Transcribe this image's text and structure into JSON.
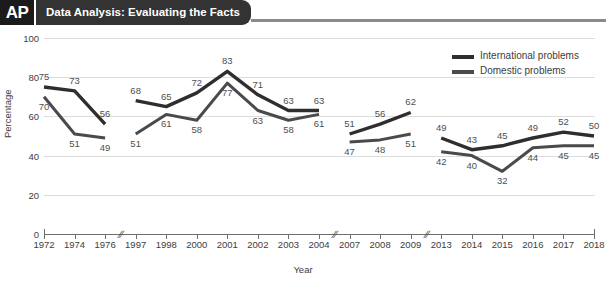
{
  "header": {
    "logo": "AP",
    "title": "Data Analysis: Evaluating the Facts"
  },
  "legend": {
    "position": "top-right",
    "items": [
      {
        "label": "International problems",
        "color": "#2e2e2e"
      },
      {
        "label": "Domestic problems",
        "color": "#4a4a4a"
      }
    ]
  },
  "colors": {
    "international": "#2e2e2e",
    "domestic": "#4a4a4a",
    "gridline": "#dcdcdc",
    "axis": "#6e6e6e",
    "header_dark": "#333333",
    "logo_bg": "#1b1b1b",
    "text": "#3d3d3d"
  },
  "chart_data": {
    "type": "line",
    "title": "",
    "xlabel": "Year",
    "ylabel": "Percentage",
    "ylim": [
      0,
      100
    ],
    "yticks": [
      0,
      20,
      40,
      60,
      80,
      100
    ],
    "grid": true,
    "axis_breaks_after": [
      "1976",
      "2004",
      "2009"
    ],
    "categories": [
      "1972",
      "1974",
      "1976",
      "1997",
      "1998",
      "2000",
      "2001",
      "2002",
      "2003",
      "2004",
      "2007",
      "2008",
      "2009",
      "2013",
      "2014",
      "2015",
      "2016",
      "2017",
      "2018"
    ],
    "series": [
      {
        "name": "International problems",
        "values": [
          75,
          73,
          56,
          68,
          65,
          72,
          83,
          71,
          63,
          63,
          51,
          56,
          62,
          49,
          43,
          45,
          49,
          52,
          50
        ]
      },
      {
        "name": "Domestic problems",
        "values": [
          70,
          51,
          49,
          51,
          61,
          58,
          77,
          63,
          58,
          61,
          47,
          48,
          51,
          42,
          40,
          32,
          44,
          45,
          45
        ]
      }
    ]
  }
}
